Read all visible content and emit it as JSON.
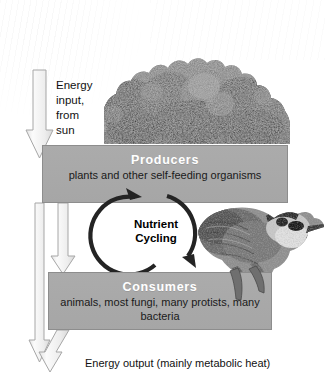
{
  "diagram": {
    "energy_input": {
      "label": "Energy\ninput,\nfrom\nsun",
      "arrow_name": "sun-energy-arrow",
      "direction": "down"
    },
    "energy_output": {
      "label": "Energy output (mainly metabolic heat)",
      "arrow_name": "energy-output-arrow",
      "direction": "down"
    },
    "cycle": {
      "label": "Nutrient\nCycling",
      "arrow_up_name": "nutrient-to-producers-arrow",
      "arrow_down_name": "nutrient-to-consumers-arrow"
    },
    "boxes": [
      {
        "id": "producers",
        "title": "Producers",
        "subtitle": "plants and other\nself-feeding organisms"
      },
      {
        "id": "consumers",
        "title": "Consumers",
        "subtitle": "animals, most fungi,\nmany protists, many bacteria"
      }
    ],
    "images": [
      {
        "name": "forest-canopy-photo",
        "alt": "Dense forest tree canopy"
      },
      {
        "name": "bird-photo",
        "alt": "Blue jay perched, holding food in beak"
      }
    ],
    "colors": {
      "box_fill": "#a8a8a8",
      "box_border": "#8d8d8d",
      "box_title_text": "#ffffff",
      "body_text": "#111111",
      "arrow_fill": "#f2f2f2",
      "arrow_stroke": "#9a9a9a",
      "cycle_arrow": "#2b2b2b",
      "background": "#ffffff"
    }
  }
}
